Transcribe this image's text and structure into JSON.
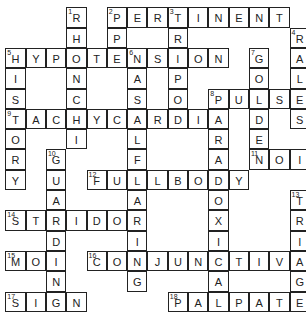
{
  "puzzle": {
    "cell_size": 20.3,
    "rows": 15,
    "cols": 15,
    "entries": [
      {
        "number": "1",
        "direction": "down",
        "row": 0,
        "col": 3,
        "answer": "RHONCHI"
      },
      {
        "number": "2",
        "direction": "across",
        "row": 0,
        "col": 5,
        "answer": "PERTINENT"
      },
      {
        "number": "2",
        "direction": "down",
        "row": 0,
        "col": 5,
        "answer": "PPE"
      },
      {
        "number": "3",
        "direction": "down",
        "row": 0,
        "col": 8,
        "answer": "TRIPOD"
      },
      {
        "number": "4",
        "direction": "down",
        "row": 1,
        "col": 14,
        "answer": "RALES"
      },
      {
        "number": "5",
        "direction": "across",
        "row": 2,
        "col": 0,
        "answer": "HYPOTENSION"
      },
      {
        "number": "5",
        "direction": "down",
        "row": 2,
        "col": 0,
        "answer": "HISTORY"
      },
      {
        "number": "6",
        "direction": "down",
        "row": 2,
        "col": 6,
        "answer": "NASALFLARING"
      },
      {
        "number": "7",
        "direction": "down",
        "row": 2,
        "col": 12,
        "answer": "GOLDEN"
      },
      {
        "number": "8",
        "direction": "across",
        "row": 4,
        "col": 10,
        "answer": "PULSE"
      },
      {
        "number": "8",
        "direction": "down",
        "row": 4,
        "col": 10,
        "answer": "PARADOXICAL"
      },
      {
        "number": "9",
        "direction": "across",
        "row": 5,
        "col": 0,
        "answer": "TACHYCARDIA"
      },
      {
        "number": "10",
        "direction": "down",
        "row": 7,
        "col": 2,
        "answer": "GUARDING"
      },
      {
        "number": "11",
        "direction": "across",
        "row": 7,
        "col": 12,
        "answer": "NOI"
      },
      {
        "number": "12",
        "direction": "across",
        "row": 8,
        "col": 4,
        "answer": "FULLBODY"
      },
      {
        "number": "13",
        "direction": "down",
        "row": 9,
        "col": 14,
        "answer": "TRIAGE"
      },
      {
        "number": "14",
        "direction": "across",
        "row": 10,
        "col": 0,
        "answer": "STRIDOR"
      },
      {
        "number": "15",
        "direction": "across",
        "row": 12,
        "col": 0,
        "answer": "MOI"
      },
      {
        "number": "16",
        "direction": "across",
        "row": 12,
        "col": 4,
        "answer": "CONJUNCTIVA"
      },
      {
        "number": "17",
        "direction": "across",
        "row": 14,
        "col": 0,
        "answer": "SIGN"
      },
      {
        "number": "18",
        "direction": "across",
        "row": 14,
        "col": 8,
        "answer": "PALPATE"
      }
    ]
  }
}
